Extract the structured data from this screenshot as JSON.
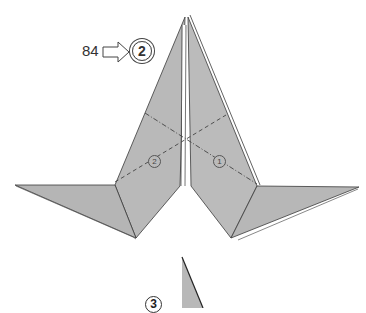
{
  "diagram": {
    "reference_page": "84",
    "arrow_icon": "right-outline-arrow",
    "target_step": "2",
    "current_step_marker": "3",
    "fold_markers": [
      {
        "label": "1",
        "kind": "dash-dot valley fold"
      },
      {
        "label": "2",
        "kind": "dashed valley fold"
      }
    ],
    "colors": {
      "paper": "#b8b8b8",
      "edge": "#3a3a3a",
      "fold_line": "#444444",
      "background": "#ffffff"
    }
  }
}
